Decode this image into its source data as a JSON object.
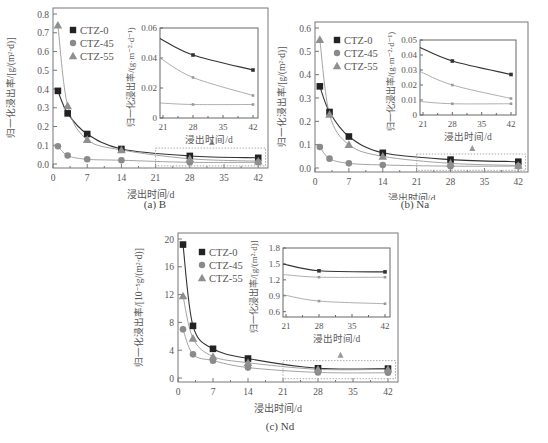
{
  "figure": {
    "captions": [
      "(a) B",
      "(b) Na",
      "(c) Nd"
    ],
    "xlabel": "浸出时间/d",
    "legend": [
      "CTZ-0",
      "CTZ-45",
      "CTZ-55"
    ],
    "colors": {
      "CTZ-0": "#222222",
      "CTZ-45": "#888888",
      "CTZ-55": "#999999",
      "axis": "#666666",
      "inset_box": "#aaaaaa"
    }
  },
  "chart_data": [
    {
      "type": "line",
      "title": "(a) B",
      "xlabel": "浸出时间/d",
      "ylabel": "归一化浸出率/[g/(m²·d)]",
      "xticks": [
        0,
        7,
        14,
        21,
        28,
        35,
        42
      ],
      "yticks": [
        0.0,
        0.1,
        0.2,
        0.3,
        0.4,
        0.5,
        0.6,
        0.7,
        0.8
      ],
      "ylim": [
        0,
        0.8
      ],
      "xlim": [
        0,
        44
      ],
      "x": [
        1,
        3,
        7,
        14,
        28,
        42
      ],
      "series": [
        {
          "name": "CTZ-0",
          "marker": "square",
          "values": [
            0.39,
            0.27,
            0.16,
            0.08,
            0.043,
            0.033
          ]
        },
        {
          "name": "CTZ-45",
          "marker": "circle",
          "values": [
            0.095,
            0.045,
            0.025,
            0.02,
            0.009,
            0.009
          ]
        },
        {
          "name": "CTZ-55",
          "marker": "triangle",
          "values": [
            0.74,
            0.31,
            0.13,
            0.075,
            0.028,
            0.015
          ]
        }
      ],
      "inset": {
        "xlabel": "浸出时间/d",
        "ylabel": "归一化浸出率/(g·m⁻²·d⁻¹)",
        "xticks": [
          21,
          28,
          35,
          42
        ],
        "yticks": [
          0,
          0.02,
          0.04,
          0.06
        ],
        "ylim": [
          0,
          0.06
        ],
        "x": [
          21,
          28,
          42
        ],
        "series": [
          {
            "name": "CTZ-0",
            "values": [
              0.053,
              0.042,
              0.032
            ]
          },
          {
            "name": "CTZ-45",
            "values": [
              0.01,
              0.009,
              0.009
            ]
          },
          {
            "name": "CTZ-55",
            "values": [
              0.04,
              0.027,
              0.015
            ]
          }
        ]
      }
    },
    {
      "type": "line",
      "title": "(b) Na",
      "xlabel": "浸出时间/d",
      "ylabel": "归一化浸出率/[g/(m²·d)]",
      "xticks": [
        0,
        7,
        14,
        21,
        28,
        35,
        42
      ],
      "yticks": [
        0.0,
        0.1,
        0.2,
        0.3,
        0.4,
        0.5,
        0.6
      ],
      "ylim": [
        0,
        0.6
      ],
      "xlim": [
        0,
        44
      ],
      "x": [
        1,
        3,
        7,
        14,
        28,
        42
      ],
      "series": [
        {
          "name": "CTZ-0",
          "marker": "square",
          "values": [
            0.35,
            0.24,
            0.135,
            0.065,
            0.036,
            0.027
          ]
        },
        {
          "name": "CTZ-45",
          "marker": "circle",
          "values": [
            0.09,
            0.04,
            0.02,
            0.013,
            0.008,
            0.008
          ]
        },
        {
          "name": "CTZ-55",
          "marker": "triangle",
          "values": [
            0.55,
            0.23,
            0.1,
            0.05,
            0.02,
            0.011
          ]
        }
      ],
      "inset": {
        "xlabel": "浸出时间/d",
        "ylabel": "归一化浸出率/(g·m⁻²·d⁻¹)",
        "xticks": [
          21,
          28,
          35,
          42
        ],
        "yticks": [
          0,
          0.01,
          0.02,
          0.03,
          0.04,
          0.05
        ],
        "ylim": [
          0,
          0.05
        ],
        "x": [
          21,
          28,
          42
        ],
        "series": [
          {
            "name": "CTZ-0",
            "values": [
              0.045,
              0.036,
              0.027
            ]
          },
          {
            "name": "CTZ-45",
            "values": [
              0.009,
              0.0075,
              0.0075
            ]
          },
          {
            "name": "CTZ-55",
            "values": [
              0.029,
              0.02,
              0.011
            ]
          }
        ]
      }
    },
    {
      "type": "line",
      "title": "(c) Nd",
      "xlabel": "浸出时间/d",
      "ylabel": "归一化浸出率/[10⁻⁵g/(m²·d)]",
      "xticks": [
        0,
        7,
        14,
        21,
        28,
        35,
        42
      ],
      "yticks": [
        0,
        4,
        8,
        12,
        16,
        20
      ],
      "ylim": [
        0,
        20
      ],
      "xlim": [
        0,
        44
      ],
      "x": [
        1,
        3,
        7,
        14,
        28,
        42
      ],
      "series": [
        {
          "name": "CTZ-0",
          "marker": "square",
          "values": [
            19.2,
            7.5,
            4.2,
            2.8,
            1.4,
            1.35
          ]
        },
        {
          "name": "CTZ-45",
          "marker": "circle",
          "values": [
            7.0,
            3.4,
            2.5,
            1.5,
            0.8,
            0.75
          ]
        },
        {
          "name": "CTZ-55",
          "marker": "triangle",
          "values": [
            11.8,
            5.7,
            3.1,
            2.2,
            1.25,
            1.25
          ]
        }
      ],
      "inset": {
        "xlabel": "浸出时间/d",
        "ylabel": "归一化浸出率/[g/(m²·d)]",
        "xticks": [
          21,
          28,
          35,
          42
        ],
        "yticks": [
          0.6,
          0.9,
          1.2,
          1.5,
          1.8
        ],
        "ylim": [
          0.5,
          1.8
        ],
        "x": [
          21,
          28,
          42
        ],
        "series": [
          {
            "name": "CTZ-0",
            "values": [
              1.5,
              1.37,
              1.35
            ]
          },
          {
            "name": "CTZ-45",
            "values": [
              0.92,
              0.8,
              0.75
            ]
          },
          {
            "name": "CTZ-55",
            "values": [
              1.3,
              1.25,
              1.25
            ]
          }
        ]
      }
    }
  ]
}
